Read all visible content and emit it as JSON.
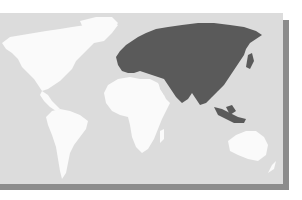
{
  "map": {
    "type": "world-map",
    "highlighted_region": "Eurasia",
    "colors": {
      "background": "#ffffff",
      "ocean": "#dcdcdc",
      "land": "#fafafa",
      "highlight": "#5a5a5a",
      "shadow": "#8c8c8c"
    },
    "regions": [
      {
        "name": "North America",
        "highlighted": false
      },
      {
        "name": "South America",
        "highlighted": false
      },
      {
        "name": "Africa",
        "highlighted": false
      },
      {
        "name": "Europe",
        "highlighted": true
      },
      {
        "name": "Asia",
        "highlighted": true
      },
      {
        "name": "Australia",
        "highlighted": false
      }
    ]
  }
}
